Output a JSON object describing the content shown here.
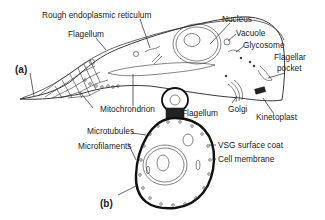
{
  "figure": {
    "panel_a": {
      "tag": "(a)",
      "labels": {
        "rough_er": "Rough endoplasmic reticulum",
        "flagellum": "Flagellum",
        "nucleus": "Nucleus",
        "vacuole": "Vacuole",
        "glycosome": "Glycosome",
        "flagellar_pocket_line1": "Flagellar",
        "flagellar_pocket_line2": "pocket",
        "mitochondrion": "Mitochrondrion",
        "golgi": "Golgi",
        "kinetoplast": "Kinetoplast",
        "microtubules": "Microtubules",
        "microfilaments": "Microfilaments"
      }
    },
    "panel_b": {
      "tag": "(b)",
      "labels": {
        "flagellum": "Flagellum",
        "vsg_surface_coat": "VSG surface coat",
        "cell_membrane": "Cell membrane"
      }
    }
  }
}
